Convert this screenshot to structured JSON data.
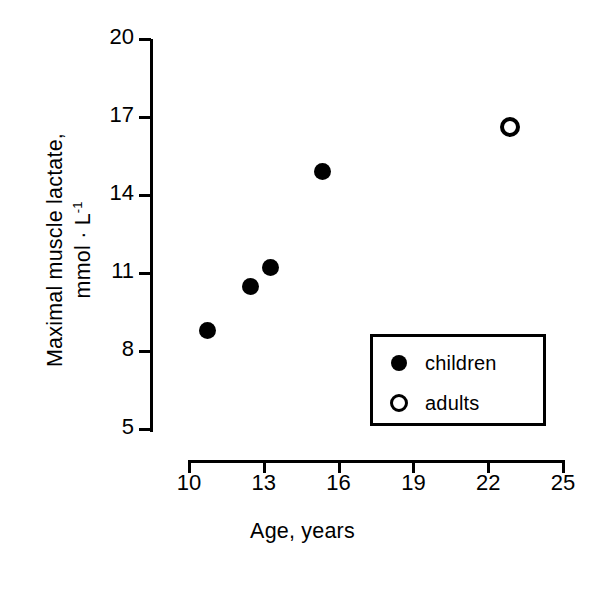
{
  "chart_data": {
    "type": "scatter",
    "title": "",
    "xlabel": "Age,  years",
    "ylabel_line1": "Maximal muscle lactate,",
    "ylabel_line2": "mmol · L",
    "ylabel_line2_sup": "-1",
    "xlim": [
      10,
      25
    ],
    "ylim": [
      5,
      20
    ],
    "xticks": [
      10,
      13,
      16,
      19,
      22,
      25
    ],
    "yticks": [
      5,
      8,
      11,
      14,
      17,
      20
    ],
    "xtick_labels": [
      "10",
      "13",
      "16",
      "19",
      "22",
      "25"
    ],
    "ytick_labels": [
      "5",
      "8",
      "11",
      "14",
      "17",
      "20"
    ],
    "grid": false,
    "legend_position": "lower-right",
    "series": [
      {
        "name": "children",
        "marker": "filled-circle",
        "color": "#000000",
        "points": [
          {
            "x": 10.8,
            "y": 8.8
          },
          {
            "x": 12.5,
            "y": 10.5
          },
          {
            "x": 13.3,
            "y": 11.2
          },
          {
            "x": 15.4,
            "y": 14.9
          }
        ]
      },
      {
        "name": "adults",
        "marker": "open-circle",
        "color": "#000000",
        "points": [
          {
            "x": 22.9,
            "y": 16.6
          }
        ]
      }
    ]
  },
  "legend": {
    "items": [
      {
        "label": "children",
        "marker": "filled-circle"
      },
      {
        "label": "adults",
        "marker": "open-circle"
      }
    ]
  }
}
